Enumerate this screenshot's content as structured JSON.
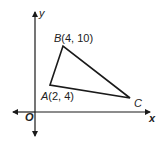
{
  "figure": {
    "type": "coordinate-plane-triangle",
    "axes": {
      "x_label": "x",
      "y_label": "y",
      "origin_label": "O"
    },
    "vertices": [
      {
        "name": "A",
        "label_letter": "A",
        "label_coords": "(2, 4)",
        "x": 2,
        "y": 4
      },
      {
        "name": "B",
        "label_letter": "B",
        "label_coords": "(4, 10)",
        "x": 4,
        "y": 10
      },
      {
        "name": "C",
        "label_letter": "C",
        "label_coords": "",
        "x": null,
        "y": null
      }
    ],
    "colors": {
      "stroke": "#1a1a1a",
      "background": "#ffffff"
    }
  }
}
